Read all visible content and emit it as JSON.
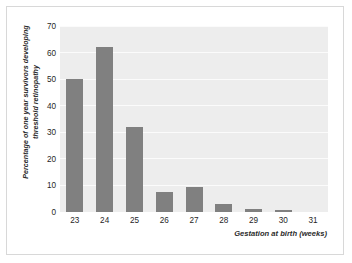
{
  "chart_data": {
    "type": "bar",
    "title": "",
    "xlabel": "Gestation at birth (weeks)",
    "ylabel_lines": [
      "Percentage of one year survivors developing",
      "threshold retinopathy"
    ],
    "ylabel": "Percentage of one year survivors developing threshold retinopathy",
    "categories": [
      "23",
      "24",
      "25",
      "26",
      "27",
      "28",
      "29",
      "30",
      "31"
    ],
    "values": [
      50,
      62,
      32,
      7.5,
      9.5,
      3,
      1,
      0.8,
      0
    ],
    "ylim": [
      0,
      70
    ],
    "yticks": [
      "0",
      "10",
      "20",
      "30",
      "40",
      "50",
      "60",
      "70"
    ],
    "ytick_values": [
      0,
      10,
      20,
      30,
      40,
      50,
      60,
      70
    ],
    "grid": true,
    "legend": false,
    "colors": {
      "bar": "#808080",
      "plot_background": "#ededed",
      "gridline": "#fbfbfb",
      "figure_background": "#ffffff",
      "border": "#d8d8d8",
      "text": "#1f1f1f"
    }
  }
}
